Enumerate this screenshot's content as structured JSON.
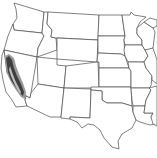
{
  "map": {
    "type": "species-range-map",
    "region": "Western and Central United States",
    "background_color": "#ffffff",
    "border_color": "#4a4a4a",
    "range": {
      "location": "California (Coast Ranges and Sierra Nevada / Central Valley)",
      "outer_color": "#9a9a9a",
      "core_color": "#3f3f3f",
      "inner_band_color": "#bdbdbd"
    }
  }
}
